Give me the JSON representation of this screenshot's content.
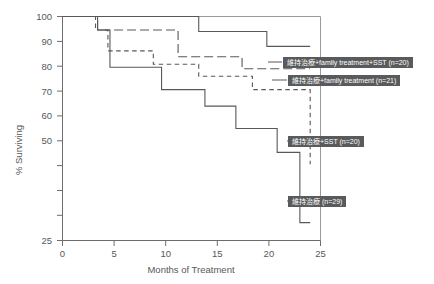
{
  "chart_data": {
    "type": "line",
    "title": "",
    "xlabel": "Months of Treatment",
    "ylabel": "% Surviving",
    "xlim": [
      0,
      25
    ],
    "ylim": [
      25,
      100
    ],
    "xticks": [
      "0",
      "5",
      "10",
      "15",
      "20",
      "25"
    ],
    "xtick_values": [
      0,
      5,
      10,
      15,
      20,
      25
    ],
    "yticks": [
      "100",
      "90",
      "80",
      "70",
      "60",
      "50",
      "",
      "",
      "25"
    ],
    "ytick_values": [
      100,
      90,
      80,
      70,
      60,
      50,
      40,
      30,
      25
    ],
    "grid": false,
    "legend_position": "inline-callouts",
    "series": [
      {
        "name": "維持治療+family treatment+SST (n=20)",
        "n": 20,
        "style": "solid",
        "color": "#58585a",
        "points": [
          [
            0,
            100
          ],
          [
            11.8,
            100
          ],
          [
            13.2,
            95
          ],
          [
            18.6,
            95
          ],
          [
            19.8,
            90
          ],
          [
            24.0,
            90
          ]
        ]
      },
      {
        "name": "維持治療+family treatment (n=21)",
        "n": 21,
        "style": "dashed-long",
        "color": "#58585a",
        "points": [
          [
            0,
            100
          ],
          [
            2.0,
            100
          ],
          [
            3.4,
            95.5
          ],
          [
            9.8,
            95.5
          ],
          [
            11.2,
            86.5
          ],
          [
            16.2,
            86.5
          ],
          [
            17.4,
            82.5
          ],
          [
            24.0,
            82.5
          ]
        ]
      },
      {
        "name": "維持治療+SST (n=20)",
        "n": 20,
        "style": "dashed-short",
        "color": "#58585a",
        "points": [
          [
            0,
            100
          ],
          [
            1.8,
            100
          ],
          [
            3.2,
            95.5
          ],
          [
            4.4,
            88.5
          ],
          [
            7.6,
            88.5
          ],
          [
            8.8,
            84
          ],
          [
            12.0,
            84
          ],
          [
            13.2,
            80
          ],
          [
            17.2,
            80
          ],
          [
            18.4,
            75.5
          ],
          [
            22.0,
            75.5
          ],
          [
            24.0,
            50.5
          ]
        ]
      },
      {
        "name": "維持治療 (n=29)",
        "n": 29,
        "style": "solid",
        "color": "#58585a",
        "points": [
          [
            0,
            100
          ],
          [
            2.2,
            100
          ],
          [
            3.4,
            95.5
          ],
          [
            4.6,
            83
          ],
          [
            8.2,
            83
          ],
          [
            9.6,
            75.5
          ],
          [
            12.6,
            75.5
          ],
          [
            13.8,
            70
          ],
          [
            15.6,
            70
          ],
          [
            16.8,
            62.5
          ],
          [
            19.6,
            62.5
          ],
          [
            20.8,
            54.5
          ],
          [
            22.4,
            54.5
          ],
          [
            23.0,
            31
          ],
          [
            24.0,
            31
          ]
        ]
      }
    ],
    "callouts": [
      {
        "label": "維持治療+family treatment+SST (n=20)",
        "x": 283,
        "y": 57
      },
      {
        "label": "維持治療+family treatment (n=21)",
        "x": 288,
        "y": 75
      },
      {
        "label": "維持治療+SST (n=20)",
        "x": 288,
        "y": 136
      },
      {
        "label": "維持治療 (n=29)",
        "x": 288,
        "y": 196
      }
    ]
  }
}
